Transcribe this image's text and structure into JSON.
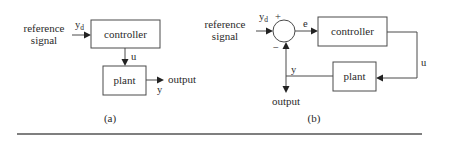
{
  "diagram_a": {
    "caption": "(a)",
    "input_label_line1": "reference",
    "input_label_line2": "signal",
    "reference_symbol": "y",
    "reference_subscript": "d",
    "controller_label": "controller",
    "control_signal": "u",
    "plant_label": "plant",
    "plant_output_symbol": "y",
    "output_label": "output"
  },
  "diagram_b": {
    "caption": "(b)",
    "input_label_line1": "reference",
    "input_label_line2": "signal",
    "reference_symbol": "y",
    "reference_subscript": "d",
    "plus_sign": "+",
    "minus_sign": "−",
    "error_symbol": "e",
    "controller_label": "controller",
    "control_signal": "u",
    "plant_label": "plant",
    "feedback_symbol": "y",
    "output_label": "output"
  }
}
